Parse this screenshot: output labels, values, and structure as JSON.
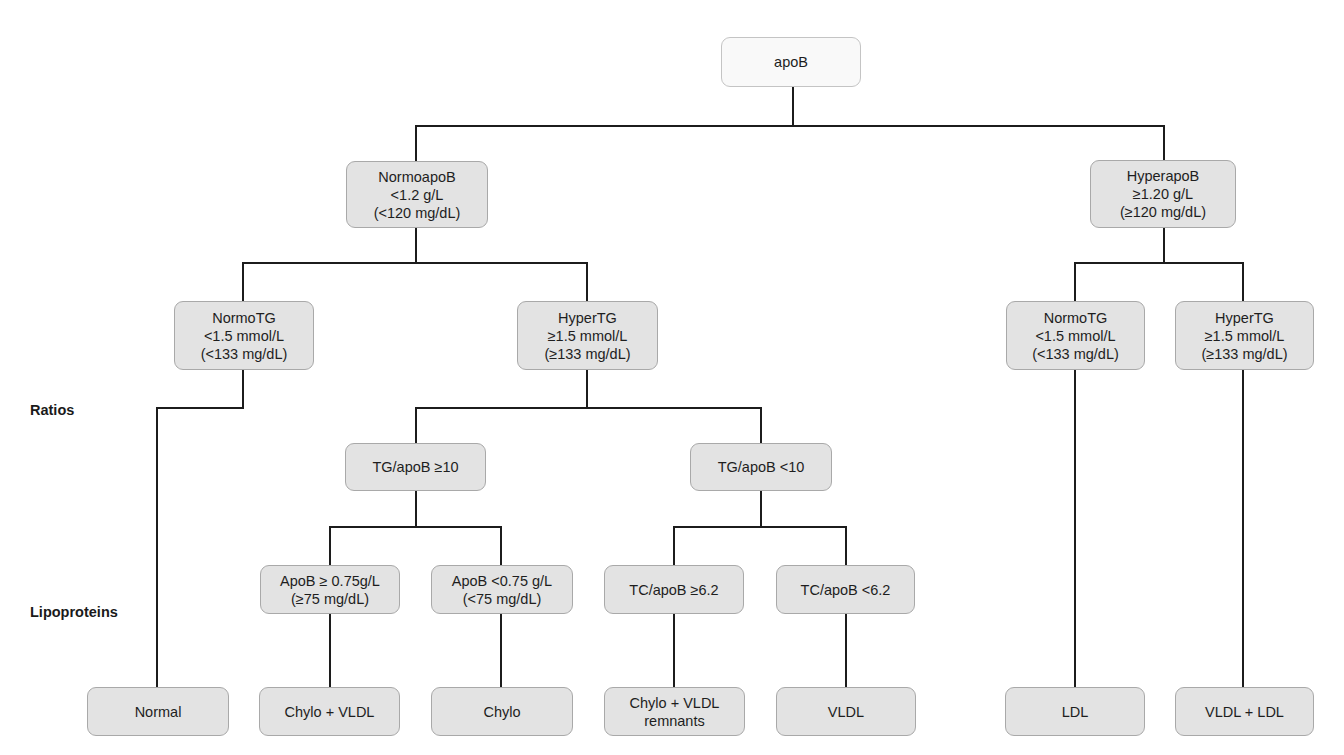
{
  "diagram": {
    "type": "decision-tree",
    "title": "apoB",
    "side_labels": {
      "ratios": "Ratios",
      "lipoproteins": "Lipoproteins"
    },
    "nodes": {
      "root": {
        "lines": [
          "apoB"
        ]
      },
      "normoapob": {
        "lines": [
          "NormoapoB",
          "<1.2 g/L",
          "(<120 mg/dL)"
        ]
      },
      "hyperapob": {
        "lines": [
          "HyperapoB",
          "≥1.20 g/L",
          "(≥120 mg/dL)"
        ]
      },
      "normotg_left": {
        "lines": [
          "NormoTG",
          "<1.5 mmol/L",
          "(<133 mg/dL)"
        ]
      },
      "hypertg_left": {
        "lines": [
          "HyperTG",
          "≥1.5 mmol/L",
          "(≥133 mg/dL)"
        ]
      },
      "normotg_right": {
        "lines": [
          "NormoTG",
          "<1.5 mmol/L",
          "(<133 mg/dL)"
        ]
      },
      "hypertg_right": {
        "lines": [
          "HyperTG",
          "≥1.5 mmol/L",
          "(≥133 mg/dL)"
        ]
      },
      "tg_apob_ge10": {
        "lines": [
          "TG/apoB ≥10"
        ]
      },
      "tg_apob_lt10": {
        "lines": [
          "TG/apoB <10"
        ]
      },
      "apob_ge075": {
        "lines": [
          "ApoB ≥ 0.75g/L",
          "(≥75 mg/dL)"
        ]
      },
      "apob_lt075": {
        "lines": [
          "ApoB <0.75 g/L",
          "(<75 mg/dL)"
        ]
      },
      "tc_apob_ge62": {
        "lines": [
          "TC/apoB ≥6.2"
        ]
      },
      "tc_apob_lt62": {
        "lines": [
          "TC/apoB <6.2"
        ]
      },
      "result_normal": {
        "lines": [
          "Normal"
        ]
      },
      "result_chylo_vldl": {
        "lines": [
          "Chylo + VLDL"
        ]
      },
      "result_chylo": {
        "lines": [
          "Chylo"
        ]
      },
      "result_chylo_vldl_remnants": {
        "lines": [
          "Chylo + VLDL",
          "remnants"
        ]
      },
      "result_vldl": {
        "lines": [
          "VLDL"
        ]
      },
      "result_ldl": {
        "lines": [
          "LDL"
        ]
      },
      "result_vldl_ldl": {
        "lines": [
          "VLDL + LDL"
        ]
      }
    },
    "edges": [
      [
        "root",
        "normoapob"
      ],
      [
        "root",
        "hyperapob"
      ],
      [
        "normoapob",
        "normotg_left"
      ],
      [
        "normoapob",
        "hypertg_left"
      ],
      [
        "hyperapob",
        "normotg_right"
      ],
      [
        "hyperapob",
        "hypertg_right"
      ],
      [
        "normotg_left",
        "result_normal"
      ],
      [
        "hypertg_left",
        "tg_apob_ge10"
      ],
      [
        "hypertg_left",
        "tg_apob_lt10"
      ],
      [
        "tg_apob_ge10",
        "apob_ge075"
      ],
      [
        "tg_apob_ge10",
        "apob_lt075"
      ],
      [
        "tg_apob_lt10",
        "tc_apob_ge62"
      ],
      [
        "tg_apob_lt10",
        "tc_apob_lt62"
      ],
      [
        "apob_ge075",
        "result_chylo_vldl"
      ],
      [
        "apob_lt075",
        "result_chylo"
      ],
      [
        "tc_apob_ge62",
        "result_chylo_vldl_remnants"
      ],
      [
        "tc_apob_lt62",
        "result_vldl"
      ],
      [
        "normotg_right",
        "result_ldl"
      ],
      [
        "hypertg_right",
        "result_vldl_ldl"
      ]
    ],
    "colors": {
      "node_fill": "#e3e3e3",
      "root_fill": "#f9f9f9",
      "node_border": "#a9a9a9",
      "connector": "#1c1c1c",
      "text": "#1e1e1e"
    }
  }
}
